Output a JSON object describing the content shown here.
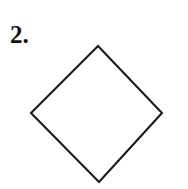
{
  "page": {
    "background_color": "#ffffff",
    "width": 188,
    "height": 189
  },
  "problem": {
    "number_label": "2."
  },
  "figure": {
    "name": "rhombus-diamond",
    "stroke_color": "#1a1a1a",
    "fill_color": "#ffffff",
    "stroke_width": 2,
    "vertices": [
      {
        "name": "top",
        "x": 98,
        "y": 46
      },
      {
        "name": "right",
        "x": 162,
        "y": 113
      },
      {
        "name": "bottom",
        "x": 99,
        "y": 182
      },
      {
        "name": "left",
        "x": 31,
        "y": 113
      }
    ],
    "points_attr": "98,46 162,113 99,182 31,113"
  }
}
